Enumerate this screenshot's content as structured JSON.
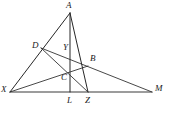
{
  "figure": {
    "background_color": "#ffffff",
    "line_color": "#262626",
    "label_color": "#1a1a1a",
    "points": [
      {
        "id": "A",
        "label": "A",
        "x": 70,
        "y": 13,
        "label_x": 66,
        "label_y": 1
      },
      {
        "id": "D",
        "label": "D",
        "x": 41,
        "y": 48,
        "label_x": 32,
        "label_y": 41
      },
      {
        "id": "Y",
        "label": "Y",
        "x": 70,
        "y": 52,
        "label_x": 63,
        "label_y": 43
      },
      {
        "id": "B",
        "label": "B",
        "x": 88,
        "y": 66,
        "label_x": 90,
        "label_y": 54
      },
      {
        "id": "C",
        "label": "C",
        "x": 70,
        "y": 75,
        "label_x": 61,
        "label_y": 73
      },
      {
        "id": "X",
        "label": "X",
        "x": 10,
        "y": 92,
        "label_x": 1,
        "label_y": 85
      },
      {
        "id": "L",
        "label": "L",
        "x": 70,
        "y": 92,
        "label_x": 67,
        "label_y": 96
      },
      {
        "id": "Z",
        "label": "Z",
        "x": 88,
        "y": 92,
        "label_x": 85,
        "label_y": 96
      },
      {
        "id": "M",
        "label": "M",
        "x": 152,
        "y": 92,
        "label_x": 155,
        "label_y": 84
      }
    ],
    "segments": [
      {
        "name": "segment-X-M-baseline",
        "from": "X",
        "to": "M",
        "style": "base"
      },
      {
        "name": "segment-A-X",
        "from": "A",
        "to": "X",
        "style": "normal"
      },
      {
        "name": "segment-A-L",
        "from": "A",
        "to": "L",
        "style": "normal"
      },
      {
        "name": "segment-A-Z",
        "from": "A",
        "to": "Z",
        "style": "normal"
      },
      {
        "name": "segment-D-M",
        "from": "D",
        "to": "M",
        "style": "thin"
      },
      {
        "name": "segment-D-Z",
        "from": "D",
        "to": "Z",
        "style": "thin"
      },
      {
        "name": "segment-X-B",
        "from": "X",
        "to": "B",
        "style": "thin"
      }
    ]
  }
}
